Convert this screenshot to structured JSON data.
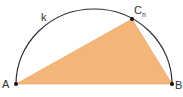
{
  "diagram": {
    "arc_label": "k",
    "points": {
      "A": {
        "label": "A",
        "x": 16,
        "y": 84
      },
      "B": {
        "label": "B",
        "x": 172,
        "y": 84
      },
      "C": {
        "label": "C",
        "subscript": "n",
        "x": 132,
        "y": 19
      }
    },
    "colors": {
      "triangle_fill": "#f4b678",
      "arc_stroke": "#2b2b3a",
      "point": "#111111"
    }
  }
}
